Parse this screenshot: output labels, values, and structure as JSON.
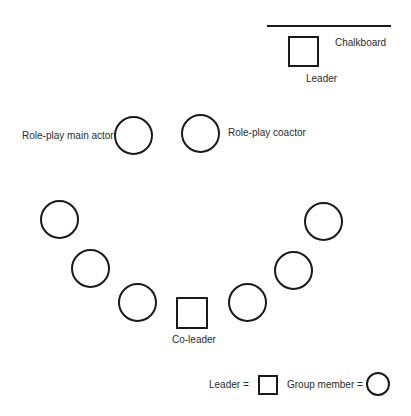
{
  "diagram": {
    "chalkboard": {
      "label": "Chalkboard"
    },
    "leader": {
      "label": "Leader"
    },
    "main_actor": {
      "label": "Role-play main actor"
    },
    "coactor": {
      "label": "Role-play coactor"
    },
    "co_leader": {
      "label": "Co-leader"
    },
    "group_members": [
      {
        "id": "member-1"
      },
      {
        "id": "member-2"
      },
      {
        "id": "member-3"
      },
      {
        "id": "member-4"
      },
      {
        "id": "member-5"
      },
      {
        "id": "member-6"
      }
    ]
  },
  "legend": {
    "leader_label": "Leader =",
    "member_label": "Group member ="
  },
  "colors": {
    "stroke": "#1a1a1a",
    "text": "#2b2b2b",
    "background": "#ffffff"
  }
}
